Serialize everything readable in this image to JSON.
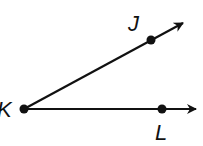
{
  "diagram": {
    "type": "angle",
    "vertex": {
      "label": "K",
      "x": 24,
      "y": 109
    },
    "points": [
      {
        "label": "J",
        "x": 151,
        "y": 40,
        "arrow_tip": {
          "x": 183,
          "y": 23
        }
      },
      {
        "label": "L",
        "x": 162,
        "y": 109,
        "arrow_tip": {
          "x": 196,
          "y": 109
        }
      }
    ],
    "colors": {
      "stroke": "#111111",
      "background": "#ffffff"
    }
  }
}
